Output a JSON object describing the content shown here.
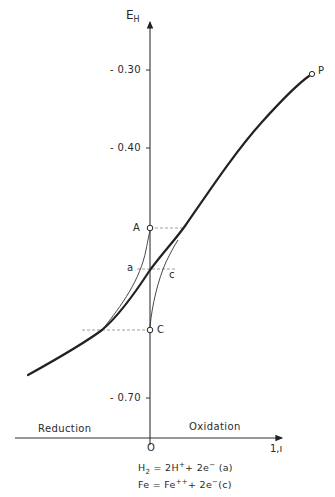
{
  "diagram": {
    "y_axis": {
      "label_main": "E",
      "label_sub": "H",
      "ticks": [
        {
          "label": "- 0.30",
          "y": 70
        },
        {
          "label": "- 0.40",
          "y": 148
        },
        {
          "label": "- 0.70",
          "y": 398
        }
      ]
    },
    "x_axis": {
      "origin_label": "O",
      "end_label": "1,ı",
      "left_region": "Reduction",
      "right_region": "Oxidation"
    },
    "points": {
      "A": "A",
      "C": "C",
      "P": "P",
      "a": "a",
      "c": "c"
    },
    "equations": {
      "eq1": {
        "lhs": "H",
        "lhs_sub": "2",
        "mid": " = 2H",
        "mid_sup": "+",
        "rhs": "+ 2e",
        "rhs_sup": "−",
        "tag": " (a)"
      },
      "eq2": {
        "lhs": "Fe = Fe",
        "lhs_sup": "++",
        "rhs": "+ 2e",
        "rhs_sup": "−",
        "tag": "(c)"
      }
    }
  }
}
